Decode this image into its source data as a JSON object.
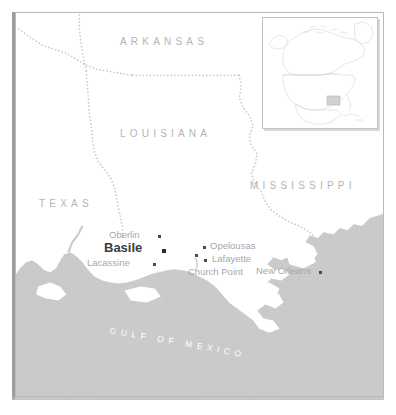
{
  "map": {
    "title": "Location map of Basile, Louisiana",
    "colors": {
      "water": "#cccccc",
      "land": "#ffffff",
      "state_label": "#b4b4b4",
      "city_label": "#a8a8a8",
      "highlight_label": "#3c3c3c",
      "dot": "#4a4a4a",
      "border_dots": "#c0c0c0",
      "frame": "#b9b9b9",
      "water_text": "#ffffff"
    },
    "state_labels": [
      {
        "name": "ARKANSAS",
        "x": 104,
        "y": 23
      },
      {
        "name": "LOUISIANA",
        "x": 104,
        "y": 115
      },
      {
        "name": "MISSISSIPPI",
        "x": 234,
        "y": 167
      },
      {
        "name": "TEXAS",
        "x": 23,
        "y": 185
      }
    ],
    "water_label": {
      "text": "GULF OF MEXICO",
      "letters": [
        "G",
        "U",
        "L",
        "F",
        " ",
        "O",
        "F",
        " ",
        "M",
        "E",
        "X",
        "I",
        "C",
        "O"
      ]
    },
    "cities": [
      {
        "name": "Oberlin",
        "label_x": 93,
        "label_y": 222,
        "dot_x": 142,
        "dot_y": 226,
        "style": "normal",
        "anchor": "end"
      },
      {
        "name": "Basile",
        "label_x": 95,
        "label_y": 233,
        "dot_x": 145,
        "dot_y": 241,
        "style": "highlight",
        "anchor": "end"
      },
      {
        "name": "Lacassine",
        "label_x": 83,
        "label_y": 249,
        "dot_x": 137,
        "dot_y": 253,
        "style": "normal",
        "anchor": "end"
      },
      {
        "name": "Opelousas",
        "label_x": 195,
        "label_y": 232,
        "dot_x": 188,
        "dot_y": 236,
        "style": "normal",
        "anchor": "start"
      },
      {
        "name": "Lafayette",
        "label_x": 196,
        "label_y": 245,
        "dot_x": 188,
        "dot_y": 249,
        "style": "normal",
        "anchor": "start"
      },
      {
        "name": "Church Point",
        "label_x": 175,
        "label_y": 258,
        "dot_x": 184,
        "dot_y": 247,
        "style": "normal",
        "anchor": "start"
      },
      {
        "name": "New Orleans",
        "label_x": 249,
        "label_y": 258,
        "dot_x": 304,
        "dot_y": 262,
        "style": "normal",
        "anchor": "end"
      }
    ],
    "inset": {
      "region": "North America",
      "highlight_label": "Louisiana"
    }
  }
}
